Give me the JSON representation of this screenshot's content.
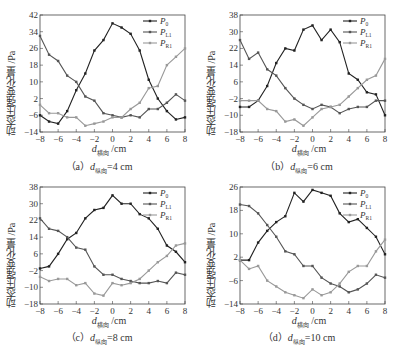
{
  "y_axis_label": "动态压强变化量 /Pa",
  "x_axis_label_main": "d",
  "x_axis_label_sub": "横向",
  "x_axis_label_unit": " /cm",
  "legend": [
    "P0",
    "PL1",
    "PR1"
  ],
  "colors": {
    "P0": "#222222",
    "PL1": "#555555",
    "PR1": "#999999"
  },
  "captions": [
    {
      "prefix": "（a）",
      "var": "d",
      "sub": "纵向",
      "value": "=4 cm"
    },
    {
      "prefix": "（b）",
      "var": "d",
      "sub": "纵向",
      "value": "=6 cm"
    },
    {
      "prefix": "（c）",
      "var": "d",
      "sub": "纵向",
      "value": "=8 cm"
    },
    {
      "prefix": "（d）",
      "var": "d",
      "sub": "纵向",
      "value": "=10 cm"
    }
  ],
  "chart_data": [
    {
      "type": "line",
      "title": "(a) d纵向=4 cm",
      "xlabel": "d横向 /cm",
      "ylabel": "动态压强变化量 /Pa",
      "x": [
        -8,
        -7,
        -6,
        -5,
        -4,
        -3,
        -2,
        -1,
        0,
        1,
        2,
        3,
        4,
        5,
        6,
        7,
        8
      ],
      "xticks": [
        -8,
        -6,
        -4,
        -2,
        0,
        2,
        4,
        6,
        8
      ],
      "yticks": [
        -14,
        -6,
        2,
        10,
        18,
        26,
        34,
        42
      ],
      "ylim": [
        -14,
        42
      ],
      "series": [
        {
          "name": "P0",
          "values": [
            -6,
            -9,
            -10,
            -4,
            6,
            14,
            25,
            30,
            38,
            36,
            33,
            25,
            11,
            2,
            -4,
            -8,
            -7
          ]
        },
        {
          "name": "PL1",
          "values": [
            32,
            23,
            20,
            13,
            10,
            3,
            1,
            -5,
            -6,
            -7,
            -6,
            -7,
            -3,
            -3,
            0,
            4,
            1
          ]
        },
        {
          "name": "PR1",
          "values": [
            -1,
            -5,
            -5,
            -7,
            -7,
            -11,
            -10,
            -9,
            -7,
            -7,
            -3,
            0,
            7,
            8,
            18,
            22,
            26
          ]
        }
      ],
      "legend_position": "upper right"
    },
    {
      "type": "line",
      "title": "(b) d纵向=6 cm",
      "xlabel": "d横向 /cm",
      "ylabel": "动态压强变化量 /Pa",
      "x": [
        -8,
        -7,
        -6,
        -5,
        -4,
        -3,
        -2,
        -1,
        0,
        1,
        2,
        3,
        4,
        5,
        6,
        7,
        8
      ],
      "xticks": [
        -8,
        -6,
        -4,
        -2,
        0,
        2,
        4,
        6,
        8
      ],
      "yticks": [
        -18,
        -10,
        -2,
        6,
        14,
        22,
        30,
        38
      ],
      "ylim": [
        -18,
        38
      ],
      "series": [
        {
          "name": "P0",
          "values": [
            -6,
            -6,
            -3,
            4,
            15,
            22,
            21,
            31,
            33,
            26,
            31,
            25,
            10,
            7,
            1,
            0,
            -10
          ]
        },
        {
          "name": "PL1",
          "values": [
            26,
            17,
            20,
            12,
            9,
            3,
            -2,
            -5,
            -7,
            -5,
            -6,
            -9,
            -7,
            -6,
            -6,
            -3,
            -3
          ]
        },
        {
          "name": "PR1",
          "values": [
            -3,
            -3,
            -3,
            -7,
            -8,
            -13,
            -12,
            -15,
            -11,
            -7,
            -6,
            -5,
            -1,
            3,
            7,
            9,
            17
          ]
        }
      ],
      "legend_position": "upper right"
    },
    {
      "type": "line",
      "title": "(c) d纵向=8 cm",
      "xlabel": "d横向 /cm",
      "ylabel": "动态压强变化量 /Pa",
      "x": [
        -8,
        -7,
        -6,
        -5,
        -4,
        -3,
        -2,
        -1,
        0,
        1,
        2,
        3,
        4,
        5,
        6,
        7,
        8
      ],
      "xticks": [
        -8,
        -6,
        -4,
        -2,
        0,
        2,
        4,
        6,
        8
      ],
      "yticks": [
        -18,
        -10,
        -2,
        6,
        14,
        22,
        30,
        38
      ],
      "ylim": [
        -18,
        38
      ],
      "series": [
        {
          "name": "P0",
          "values": [
            -1,
            0,
            6,
            13,
            16,
            23,
            27,
            28,
            34,
            30,
            30,
            25,
            23,
            18,
            10,
            7,
            2
          ]
        },
        {
          "name": "PL1",
          "values": [
            23,
            18,
            17,
            14,
            9,
            8,
            0,
            -4,
            -4,
            -6,
            -7,
            -8,
            -8,
            -7,
            -8,
            -3,
            -4
          ]
        },
        {
          "name": "PR1",
          "values": [
            -5,
            -7,
            -6,
            -6,
            -9,
            -8,
            -13,
            -14,
            -8,
            -9,
            -8,
            -6,
            -2,
            2,
            5,
            10,
            11
          ]
        }
      ],
      "legend_position": "upper right"
    },
    {
      "type": "line",
      "title": "(d) d纵向=10 cm",
      "xlabel": "d横向 /cm",
      "ylabel": "动态压强变化量 /Pa",
      "x": [
        -8,
        -7,
        -6,
        -5,
        -4,
        -3,
        -2,
        -1,
        0,
        1,
        2,
        3,
        4,
        5,
        6,
        7,
        8
      ],
      "xticks": [
        -8,
        -6,
        -4,
        -2,
        0,
        2,
        4,
        6,
        8
      ],
      "yticks": [
        -14,
        -6,
        2,
        10,
        18,
        26
      ],
      "ylim": [
        -14,
        26
      ],
      "series": [
        {
          "name": "P0",
          "values": [
            1,
            1,
            7,
            11,
            14,
            16,
            24,
            21,
            25,
            24,
            23,
            17,
            14,
            15,
            12,
            9,
            3
          ]
        },
        {
          "name": "PL1",
          "values": [
            20,
            19.5,
            17,
            13,
            9,
            4,
            3,
            -1,
            -1,
            -5,
            -7,
            -8,
            -10,
            -9,
            -7,
            -4,
            -5
          ]
        },
        {
          "name": "PR1",
          "values": [
            1,
            -2,
            -1,
            -6,
            -8,
            -10,
            -11,
            -12,
            -9,
            -11,
            -10,
            -7,
            -3,
            -1,
            -1,
            4,
            8
          ]
        }
      ],
      "legend_position": "upper right"
    }
  ]
}
